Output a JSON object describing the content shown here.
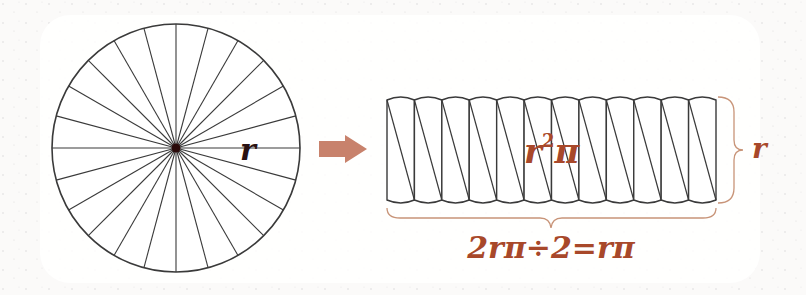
{
  "diagram": {
    "circle": {
      "cx": 176,
      "cy": 148,
      "r": 124,
      "sectors": 24,
      "stroke": "#3a3a3a",
      "center_color": "#2a0a0a"
    },
    "radius_label": "r",
    "arrow": {
      "color": "#c8826c"
    },
    "rect": {
      "x": 387,
      "y": 97,
      "w": 329,
      "h": 106,
      "columns": 12
    },
    "area_label": {
      "base": "r",
      "sup": "2",
      "tail": "π"
    },
    "height_label": "r",
    "width_label": "2rπ÷2=rπ",
    "accent": "#a8482a",
    "brace_color": "#c89478"
  }
}
